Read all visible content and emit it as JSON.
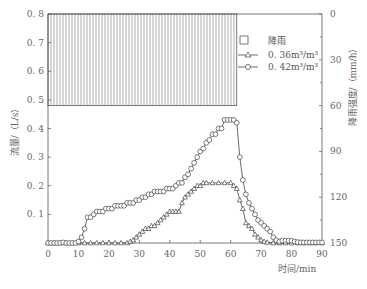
{
  "chart_data": {
    "type": "line",
    "title": "",
    "xlabel": "时间/min",
    "ylabel": "流量/（L/s）",
    "y2label": "降雨强度/（mm/h）",
    "xlim": [
      0,
      90
    ],
    "ylim": [
      0,
      0.8
    ],
    "y2lim": [
      150,
      0
    ],
    "x_ticks": [
      "0",
      "10",
      "20",
      "30",
      "40",
      "50",
      "60",
      "70",
      "80",
      "90"
    ],
    "y_ticks": [
      "0.1",
      "0.2",
      "0.3",
      "0.4",
      "0.5",
      "0.6",
      "0.7",
      "0.8"
    ],
    "y2_ticks": [
      "0",
      "30",
      "60",
      "90",
      "120",
      "150"
    ],
    "grid": false,
    "legend_position": "upper right",
    "rain": {
      "name": "降雨",
      "start": 0,
      "end": 62,
      "intensity": 60
    },
    "series": [
      {
        "name": "0.36m³/m³",
        "marker": "triangle",
        "x": [
          0,
          2,
          4,
          6,
          8,
          10,
          12,
          14,
          16,
          18,
          20,
          22,
          24,
          26,
          27,
          28,
          29,
          30,
          31,
          32,
          33,
          34,
          35,
          36,
          37,
          38,
          39,
          40,
          41,
          42,
          43,
          44,
          45,
          46,
          47,
          48,
          49,
          50,
          51,
          52,
          54,
          56,
          58,
          60,
          61,
          62,
          63,
          64,
          65,
          66,
          67,
          68,
          69,
          70,
          71,
          72,
          74,
          76,
          78,
          80,
          82,
          84,
          86,
          88,
          90
        ],
        "values": [
          0,
          0,
          0,
          0,
          0,
          0,
          0,
          0,
          0,
          0,
          0,
          0,
          0,
          0,
          0.005,
          0.01,
          0.02,
          0.03,
          0.04,
          0.05,
          0.05,
          0.06,
          0.06,
          0.07,
          0.08,
          0.09,
          0.1,
          0.11,
          0.11,
          0.11,
          0.11,
          0.14,
          0.16,
          0.17,
          0.18,
          0.19,
          0.2,
          0.2,
          0.21,
          0.21,
          0.21,
          0.21,
          0.21,
          0.21,
          0.2,
          0.19,
          0.15,
          0.12,
          0.07,
          0.06,
          0.05,
          0.03,
          0.02,
          0.01,
          0.005,
          0.002,
          0,
          0,
          0,
          0,
          0,
          0,
          0,
          0,
          0
        ]
      },
      {
        "name": "0.42m³/m³",
        "marker": "circle",
        "x": [
          0,
          1,
          2,
          3,
          4,
          5,
          6,
          7,
          8,
          9,
          10,
          11,
          12,
          13,
          14,
          15,
          16,
          17,
          18,
          19,
          20,
          21,
          22,
          23,
          24,
          25,
          26,
          27,
          28,
          29,
          30,
          31,
          32,
          33,
          34,
          35,
          36,
          37,
          38,
          39,
          40,
          41,
          42,
          43,
          44,
          45,
          46,
          47,
          48,
          49,
          50,
          51,
          52,
          53,
          54,
          55,
          56,
          57,
          58,
          59,
          60,
          61,
          62,
          63,
          64,
          65,
          66,
          67,
          68,
          69,
          70,
          71,
          72,
          73,
          74,
          75,
          76,
          77,
          78,
          79,
          80,
          81,
          82,
          83,
          84,
          85,
          86,
          87,
          88,
          89,
          90
        ],
        "values": [
          0,
          0,
          0,
          0,
          0,
          0.002,
          0,
          0,
          0,
          0,
          0.005,
          0.02,
          0.05,
          0.09,
          0.09,
          0.1,
          0.11,
          0.11,
          0.11,
          0.12,
          0.12,
          0.12,
          0.13,
          0.13,
          0.13,
          0.13,
          0.14,
          0.14,
          0.14,
          0.15,
          0.15,
          0.16,
          0.16,
          0.17,
          0.17,
          0.18,
          0.18,
          0.18,
          0.18,
          0.19,
          0.19,
          0.19,
          0.2,
          0.21,
          0.21,
          0.23,
          0.24,
          0.26,
          0.28,
          0.3,
          0.32,
          0.33,
          0.35,
          0.36,
          0.38,
          0.38,
          0.4,
          0.4,
          0.43,
          0.43,
          0.43,
          0.43,
          0.42,
          0.3,
          0.22,
          0.17,
          0.14,
          0.12,
          0.1,
          0.08,
          0.07,
          0.06,
          0.05,
          0.04,
          0.02,
          0.01,
          0.005,
          0.008,
          0.008,
          0.008,
          0.008,
          0.005,
          0.003,
          0.002,
          0.002,
          0.002,
          0.002,
          0.002,
          0.002,
          0.002,
          0.002
        ]
      }
    ]
  },
  "legend": {
    "rain_label": "降雨",
    "series1_label": "0. 36m³/m³",
    "series2_label": "0. 42m³/m³"
  },
  "axes": {
    "xlabel": "时间/min",
    "ylabel": "流量/（L/s）",
    "y2label": "降雨强度/（mm/h）"
  }
}
